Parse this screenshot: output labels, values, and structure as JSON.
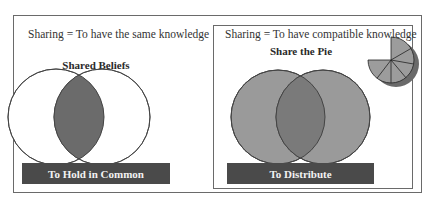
{
  "left_panel": {
    "caption": "Sharing = To have the same knowledge",
    "heading": "Shared Beliefs",
    "bar_label": "To Hold in Common",
    "venn": {
      "circle_fill": "#ffffff",
      "intersection_fill": "#6b6b6b",
      "stroke": "#555555"
    }
  },
  "right_panel": {
    "caption": "Sharing = To have compatible knowledge",
    "heading": "Share the Pie",
    "bar_label": "To Distribute",
    "venn": {
      "circle_fill": "#9a9a9a",
      "intersection_fill": "#7a7a7a",
      "stroke": "#444444"
    },
    "pie_icon": {
      "slice_fill": "#9c9c9c",
      "shadow_fill": "#6a6a6a",
      "slices": 6
    }
  },
  "colors": {
    "bar_background": "#4a4a4a",
    "bar_text": "#f2f2f2",
    "border": "#6a6a6a"
  }
}
